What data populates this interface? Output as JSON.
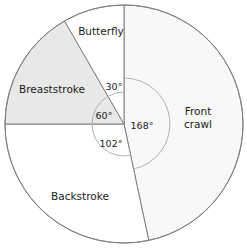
{
  "chart_data": {
    "type": "pie",
    "title": "",
    "subtitle": "",
    "xlabel": "",
    "ylabel": "",
    "legend_position": "none",
    "grid": false,
    "units": "degrees",
    "total_degrees": 360,
    "start_angle_deg": 0,
    "direction": "clockwise",
    "categories": [
      "Front crawl",
      "Backstroke",
      "Breaststroke",
      "Butterfly"
    ],
    "values": [
      168,
      102,
      60,
      30
    ],
    "annotations": [
      "168°",
      "102°",
      "60°",
      "30°"
    ],
    "slices": [
      {
        "label": "Front crawl",
        "label_line1": "Front",
        "label_line2": "crawl",
        "angle_deg": 168,
        "angle_text": "168°",
        "start_deg": 0,
        "end_deg": 168,
        "fill": "#f8f8f8",
        "arc_radius": 46,
        "label_x": 198,
        "label_y": 118,
        "angle_label_x": 142,
        "angle_label_y": 126
      },
      {
        "label": "Backstroke",
        "label_line1": "Backstroke",
        "label_line2": "",
        "angle_deg": 102,
        "angle_text": "102°",
        "start_deg": 168,
        "end_deg": 270,
        "fill": "#ffffff",
        "arc_radius": 32,
        "label_x": 80,
        "label_y": 197,
        "angle_label_x": 111,
        "angle_label_y": 144
      },
      {
        "label": "Breaststroke",
        "label_line1": "Breaststroke",
        "label_line2": "",
        "angle_deg": 60,
        "angle_text": "60°",
        "start_deg": 270,
        "end_deg": 330,
        "fill": "#e8e8e8",
        "arc_radius": 32,
        "label_x": 52,
        "label_y": 90,
        "angle_label_x": 104,
        "angle_label_y": 116
      },
      {
        "label": "Butterfly",
        "label_line1": "Butterfly",
        "label_line2": "",
        "angle_deg": 30,
        "angle_text": "30°",
        "start_deg": 330,
        "end_deg": 360,
        "fill": "#ffffff",
        "arc_radius": 32,
        "label_x": 101,
        "label_y": 32,
        "angle_label_x": 114,
        "angle_label_y": 87
      }
    ],
    "geometry": {
      "center_x": 124,
      "center_y": 124,
      "outer_radius": 119
    },
    "colors": {
      "outline": "#808080",
      "arc": "#b0b0b0",
      "text": "#1b1b1b",
      "shaded_slice": "#e8e8e8",
      "tinted_slice": "#f8f8f8",
      "plain_slice": "#ffffff",
      "background": "#ffffff"
    }
  }
}
